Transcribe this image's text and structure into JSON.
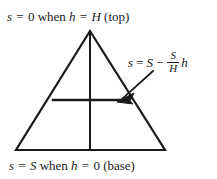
{
  "figure": {
    "name": "triangle-linear-salinity-diagram",
    "background_color": "#ffffff",
    "ink_color": "#1a1a1a"
  },
  "top_label": {
    "full_text": "s = 0 when h = H (top)",
    "parts": {
      "var_s": "s",
      "eq1": "=",
      "value_zero": "0",
      "when": "when",
      "var_h": "h",
      "eq2": "=",
      "value_H": "H",
      "position": "(top)"
    }
  },
  "bottom_label": {
    "full_text": "s = S when h = 0 (base)",
    "parts": {
      "var_s": "s",
      "eq1": "=",
      "value_S": "S",
      "when": "when",
      "var_h": "h",
      "eq2": "=",
      "value_zero": "0",
      "position": "(base)"
    }
  },
  "equation": {
    "full_text": "s = S - (S/H)h",
    "lhs": "s",
    "equals": "=",
    "term_S": "S",
    "minus": "−",
    "fraction": {
      "numerator": "S",
      "denominator": "H"
    },
    "trailing_var": "h"
  },
  "geometry": {
    "triangle": {
      "apex": [
        90,
        31
      ],
      "base_left": [
        16,
        150
      ],
      "base_right": [
        165,
        150
      ]
    },
    "center_vertical_line": {
      "x": 90,
      "y_top": 31,
      "y_bottom": 150
    },
    "horizontal_level_line": {
      "y": 100,
      "x_left": 53,
      "x_right": 128
    },
    "arrow": {
      "tail": [
        153,
        71
      ],
      "head": [
        119,
        101
      ]
    },
    "stroke_width_outline": 2.2,
    "stroke_width_inner": 2.0
  }
}
